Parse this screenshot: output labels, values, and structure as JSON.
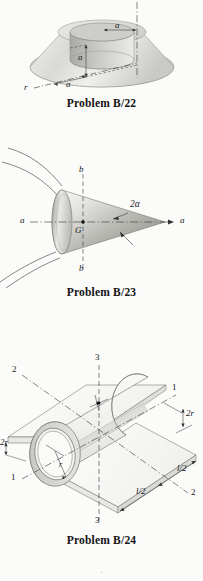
{
  "page": {
    "background_color": "#fbfbfa",
    "ink_color": "#1a1a1a",
    "bottom_mark": "·"
  },
  "figures": [
    {
      "id": "problem-b-22",
      "caption": "Problem B/22",
      "description": "Truncated cone frustum with concentric cylindrical hole",
      "shape": "frustum-with-cylindrical-hole",
      "labels": [
        {
          "name": "dim-a-top",
          "text": "a",
          "x": 118,
          "y": 32
        },
        {
          "name": "dim-a-vertical",
          "text": "a",
          "x": 81,
          "y": 58
        },
        {
          "name": "dim-a-radial",
          "text": "a",
          "x": 67,
          "y": 85
        },
        {
          "name": "axis-r",
          "text": "r",
          "x": 26,
          "y": 88
        }
      ]
    },
    {
      "id": "problem-b-23",
      "caption": "Problem B/23",
      "description": "Solid cone with centroid G, axes a-a and b-b, half apex angle alpha",
      "shape": "cone",
      "labels": [
        {
          "name": "axis-b-top",
          "text": "b",
          "x": 79,
          "y": 170
        },
        {
          "name": "axis-b-bottom",
          "text": "b",
          "x": 79,
          "y": 262
        },
        {
          "name": "axis-a-left",
          "text": "a",
          "x": 22,
          "y": 220
        },
        {
          "name": "axis-a-right",
          "text": "a",
          "x": 177,
          "y": 220
        },
        {
          "name": "apex-angle",
          "text": "2α",
          "x": 131,
          "y": 197
        },
        {
          "name": "centroid-g",
          "text": "G",
          "x": 76,
          "y": 227
        }
      ]
    },
    {
      "id": "problem-b-24",
      "caption": "Problem B/24",
      "description": "Half cylindrical shell of radius r joined to flat plates, with section axes 1-1, 2-2, 3-3",
      "shape": "half-cylinder-with-plates",
      "labels": [
        {
          "name": "axis-1-right",
          "text": "1",
          "x": 172,
          "y": 388
        },
        {
          "name": "axis-1-left",
          "text": "1",
          "x": 12,
          "y": 476
        },
        {
          "name": "axis-2-left",
          "text": "2",
          "x": 13,
          "y": 372
        },
        {
          "name": "axis-2-right",
          "text": "2",
          "x": 193,
          "y": 489
        },
        {
          "name": "axis-3-top",
          "text": "3",
          "x": 95,
          "y": 357
        },
        {
          "name": "axis-3-bottom",
          "text": "3",
          "x": 95,
          "y": 506
        },
        {
          "name": "dim-2r-right",
          "text": "2r",
          "x": 184,
          "y": 414
        },
        {
          "name": "dim-2r-left",
          "text": "2r",
          "x": 3,
          "y": 441
        },
        {
          "name": "dim-l2-upper",
          "text": "l/2",
          "x": 180,
          "y": 453
        },
        {
          "name": "dim-l2-lower",
          "text": "l/2",
          "x": 139,
          "y": 474
        },
        {
          "name": "radius-r",
          "text": "r",
          "x": 60,
          "y": 465
        }
      ]
    }
  ]
}
